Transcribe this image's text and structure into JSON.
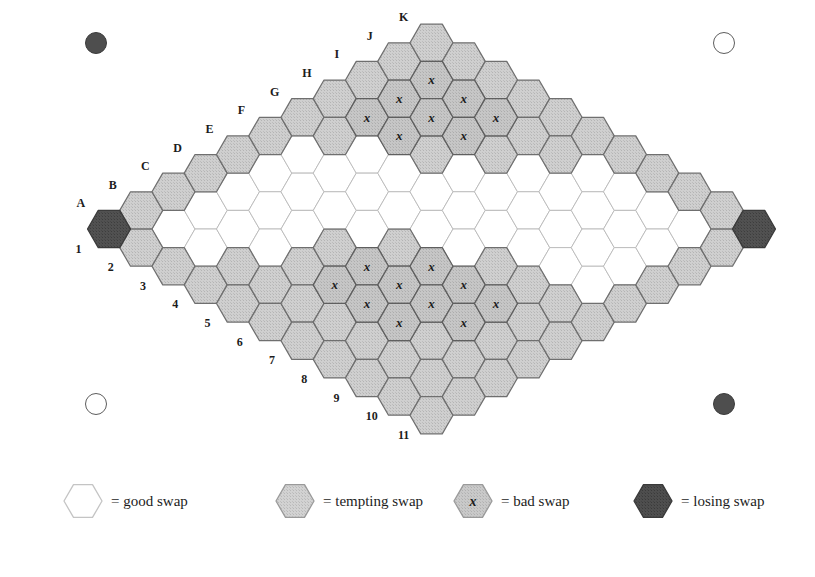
{
  "figure": {
    "board": {
      "columns": [
        "A",
        "B",
        "C",
        "D",
        "E",
        "F",
        "G",
        "H",
        "I",
        "J",
        "K"
      ],
      "rows": [
        "1",
        "2",
        "3",
        "4",
        "5",
        "6",
        "7",
        "8",
        "9",
        "10",
        "11"
      ],
      "size": 11,
      "bad_swap_mark": "x"
    },
    "colors": {
      "good": "#ffffff",
      "tempting": "#c9c9c9",
      "bad": "#c9c9c9",
      "losing": "#4e4e4e",
      "stroke": "#6b6b6b",
      "stroke_dark": "#4a4a4a",
      "text": "#1c1c1c"
    },
    "cells": [
      {
        "col": "A",
        "row": "1",
        "type": "losing"
      },
      {
        "col": "A",
        "row": "2",
        "type": "tempting"
      },
      {
        "col": "A",
        "row": "3",
        "type": "tempting"
      },
      {
        "col": "A",
        "row": "4",
        "type": "tempting"
      },
      {
        "col": "A",
        "row": "5",
        "type": "tempting"
      },
      {
        "col": "A",
        "row": "6",
        "type": "tempting"
      },
      {
        "col": "A",
        "row": "7",
        "type": "tempting"
      },
      {
        "col": "A",
        "row": "8",
        "type": "tempting"
      },
      {
        "col": "A",
        "row": "9",
        "type": "tempting"
      },
      {
        "col": "A",
        "row": "10",
        "type": "tempting"
      },
      {
        "col": "A",
        "row": "11",
        "type": "tempting"
      },
      {
        "col": "B",
        "row": "1",
        "type": "tempting"
      },
      {
        "col": "B",
        "row": "2",
        "type": "good"
      },
      {
        "col": "B",
        "row": "3",
        "type": "good"
      },
      {
        "col": "B",
        "row": "4",
        "type": "tempting"
      },
      {
        "col": "B",
        "row": "5",
        "type": "tempting"
      },
      {
        "col": "B",
        "row": "6",
        "type": "tempting"
      },
      {
        "col": "B",
        "row": "7",
        "type": "tempting"
      },
      {
        "col": "B",
        "row": "8",
        "type": "tempting"
      },
      {
        "col": "B",
        "row": "9",
        "type": "tempting"
      },
      {
        "col": "B",
        "row": "10",
        "type": "tempting"
      },
      {
        "col": "B",
        "row": "11",
        "type": "tempting"
      },
      {
        "col": "C",
        "row": "1",
        "type": "tempting"
      },
      {
        "col": "C",
        "row": "2",
        "type": "good"
      },
      {
        "col": "C",
        "row": "3",
        "type": "good"
      },
      {
        "col": "C",
        "row": "4",
        "type": "good"
      },
      {
        "col": "C",
        "row": "5",
        "type": "tempting"
      },
      {
        "col": "C",
        "row": "6",
        "type": "bad"
      },
      {
        "col": "C",
        "row": "7",
        "type": "bad"
      },
      {
        "col": "C",
        "row": "8",
        "type": "bad"
      },
      {
        "col": "C",
        "row": "9",
        "type": "tempting"
      },
      {
        "col": "C",
        "row": "10",
        "type": "tempting"
      },
      {
        "col": "C",
        "row": "11",
        "type": "tempting"
      },
      {
        "col": "D",
        "row": "1",
        "type": "tempting"
      },
      {
        "col": "D",
        "row": "2",
        "type": "good"
      },
      {
        "col": "D",
        "row": "3",
        "type": "good"
      },
      {
        "col": "D",
        "row": "4",
        "type": "good"
      },
      {
        "col": "D",
        "row": "5",
        "type": "tempting"
      },
      {
        "col": "D",
        "row": "6",
        "type": "bad"
      },
      {
        "col": "D",
        "row": "7",
        "type": "bad"
      },
      {
        "col": "D",
        "row": "8",
        "type": "bad"
      },
      {
        "col": "D",
        "row": "9",
        "type": "bad"
      },
      {
        "col": "D",
        "row": "10",
        "type": "tempting"
      },
      {
        "col": "D",
        "row": "11",
        "type": "tempting"
      },
      {
        "col": "E",
        "row": "1",
        "type": "tempting"
      },
      {
        "col": "E",
        "row": "2",
        "type": "good"
      },
      {
        "col": "E",
        "row": "3",
        "type": "good"
      },
      {
        "col": "E",
        "row": "4",
        "type": "good"
      },
      {
        "col": "E",
        "row": "5",
        "type": "good"
      },
      {
        "col": "E",
        "row": "6",
        "type": "tempting"
      },
      {
        "col": "E",
        "row": "7",
        "type": "bad"
      },
      {
        "col": "E",
        "row": "8",
        "type": "bad"
      },
      {
        "col": "E",
        "row": "9",
        "type": "bad"
      },
      {
        "col": "E",
        "row": "10",
        "type": "tempting"
      },
      {
        "col": "E",
        "row": "11",
        "type": "tempting"
      },
      {
        "col": "F",
        "row": "1",
        "type": "tempting"
      },
      {
        "col": "F",
        "row": "2",
        "type": "good"
      },
      {
        "col": "F",
        "row": "3",
        "type": "good"
      },
      {
        "col": "F",
        "row": "4",
        "type": "good"
      },
      {
        "col": "F",
        "row": "5",
        "type": "good"
      },
      {
        "col": "F",
        "row": "6",
        "type": "good"
      },
      {
        "col": "F",
        "row": "7",
        "type": "good"
      },
      {
        "col": "F",
        "row": "8",
        "type": "tempting"
      },
      {
        "col": "F",
        "row": "9",
        "type": "tempting"
      },
      {
        "col": "F",
        "row": "10",
        "type": "tempting"
      },
      {
        "col": "F",
        "row": "11",
        "type": "tempting"
      },
      {
        "col": "G",
        "row": "1",
        "type": "tempting"
      },
      {
        "col": "G",
        "row": "2",
        "type": "tempting"
      },
      {
        "col": "G",
        "row": "3",
        "type": "good"
      },
      {
        "col": "G",
        "row": "4",
        "type": "good"
      },
      {
        "col": "G",
        "row": "5",
        "type": "good"
      },
      {
        "col": "G",
        "row": "6",
        "type": "good"
      },
      {
        "col": "G",
        "row": "7",
        "type": "good"
      },
      {
        "col": "G",
        "row": "8",
        "type": "good"
      },
      {
        "col": "G",
        "row": "9",
        "type": "good"
      },
      {
        "col": "G",
        "row": "10",
        "type": "good"
      },
      {
        "col": "G",
        "row": "11",
        "type": "tempting"
      },
      {
        "col": "H",
        "row": "1",
        "type": "tempting"
      },
      {
        "col": "H",
        "row": "2",
        "type": "bad"
      },
      {
        "col": "H",
        "row": "3",
        "type": "bad"
      },
      {
        "col": "H",
        "row": "4",
        "type": "tempting"
      },
      {
        "col": "H",
        "row": "5",
        "type": "good"
      },
      {
        "col": "H",
        "row": "6",
        "type": "good"
      },
      {
        "col": "H",
        "row": "7",
        "type": "good"
      },
      {
        "col": "H",
        "row": "8",
        "type": "good"
      },
      {
        "col": "H",
        "row": "9",
        "type": "good"
      },
      {
        "col": "H",
        "row": "10",
        "type": "good"
      },
      {
        "col": "H",
        "row": "11",
        "type": "tempting"
      },
      {
        "col": "I",
        "row": "1",
        "type": "tempting"
      },
      {
        "col": "I",
        "row": "2",
        "type": "bad"
      },
      {
        "col": "I",
        "row": "3",
        "type": "bad"
      },
      {
        "col": "I",
        "row": "4",
        "type": "bad"
      },
      {
        "col": "I",
        "row": "5",
        "type": "tempting"
      },
      {
        "col": "I",
        "row": "6",
        "type": "good"
      },
      {
        "col": "I",
        "row": "7",
        "type": "good"
      },
      {
        "col": "I",
        "row": "8",
        "type": "good"
      },
      {
        "col": "I",
        "row": "9",
        "type": "good"
      },
      {
        "col": "I",
        "row": "10",
        "type": "good"
      },
      {
        "col": "I",
        "row": "11",
        "type": "tempting"
      },
      {
        "col": "J",
        "row": "1",
        "type": "tempting"
      },
      {
        "col": "J",
        "row": "2",
        "type": "bad"
      },
      {
        "col": "J",
        "row": "3",
        "type": "bad"
      },
      {
        "col": "J",
        "row": "4",
        "type": "bad"
      },
      {
        "col": "J",
        "row": "5",
        "type": "tempting"
      },
      {
        "col": "J",
        "row": "6",
        "type": "tempting"
      },
      {
        "col": "J",
        "row": "7",
        "type": "good"
      },
      {
        "col": "J",
        "row": "8",
        "type": "good"
      },
      {
        "col": "J",
        "row": "9",
        "type": "good"
      },
      {
        "col": "J",
        "row": "10",
        "type": "good"
      },
      {
        "col": "J",
        "row": "11",
        "type": "tempting"
      },
      {
        "col": "K",
        "row": "1",
        "type": "tempting"
      },
      {
        "col": "K",
        "row": "2",
        "type": "tempting"
      },
      {
        "col": "K",
        "row": "3",
        "type": "tempting"
      },
      {
        "col": "K",
        "row": "4",
        "type": "tempting"
      },
      {
        "col": "K",
        "row": "5",
        "type": "tempting"
      },
      {
        "col": "K",
        "row": "6",
        "type": "tempting"
      },
      {
        "col": "K",
        "row": "7",
        "type": "tempting"
      },
      {
        "col": "K",
        "row": "8",
        "type": "tempting"
      },
      {
        "col": "K",
        "row": "9",
        "type": "tempting"
      },
      {
        "col": "K",
        "row": "10",
        "type": "tempting"
      },
      {
        "col": "K",
        "row": "11",
        "type": "losing"
      }
    ]
  },
  "corner_markers": [
    {
      "position": "top-left",
      "style": "filled"
    },
    {
      "position": "top-right",
      "style": "hollow"
    },
    {
      "position": "bottom-left",
      "style": "hollow"
    },
    {
      "position": "bottom-right",
      "style": "filled"
    }
  ],
  "legend": {
    "items": [
      {
        "swatch": "good",
        "mark": "",
        "label": "= good swap"
      },
      {
        "swatch": "tempting",
        "mark": "",
        "label": "= tempting swap"
      },
      {
        "swatch": "bad",
        "mark": "x",
        "label": "= bad swap"
      },
      {
        "swatch": "losing",
        "mark": "",
        "label": "= losing swap"
      }
    ]
  }
}
